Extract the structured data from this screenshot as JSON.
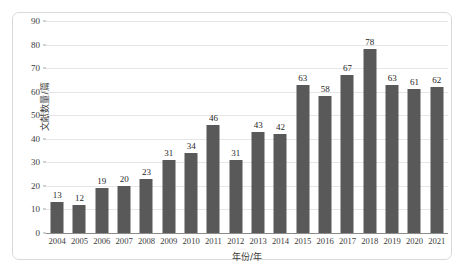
{
  "chart_data": {
    "type": "bar",
    "title": "",
    "subtitle": "",
    "xlabel": "年份/年",
    "ylabel": "文献数量/篇",
    "categories": [
      "2004",
      "2005",
      "2006",
      "2007",
      "2008",
      "2009",
      "2010",
      "2011",
      "2012",
      "2013",
      "2014",
      "2015",
      "2016",
      "2017",
      "2018",
      "2019",
      "2020",
      "2021"
    ],
    "values": [
      13,
      12,
      19,
      20,
      23,
      31,
      34,
      46,
      31,
      43,
      42,
      63,
      58,
      67,
      78,
      63,
      61,
      62
    ],
    "data_labels": [
      "13",
      "12",
      "19",
      "20",
      "23",
      "31",
      "34",
      "46",
      "31",
      "43",
      "42",
      "63",
      "58",
      "67",
      "78",
      "63",
      "61",
      "62"
    ],
    "ylim": [
      0,
      90
    ],
    "ytick_values": [
      0,
      10,
      20,
      30,
      40,
      50,
      60,
      70,
      80,
      90
    ],
    "ytick_labels": [
      "0",
      "10",
      "20",
      "30",
      "40",
      "50",
      "60",
      "70",
      "80",
      "90"
    ],
    "grid": true,
    "legend": null,
    "legend_position": "none",
    "bar_color": "#595959",
    "gridline_color": "#e6e6e6",
    "axis_color": "#8c8c8c",
    "frame_color": "#d9d9d9",
    "background_color": "#ffffff",
    "label_color": "#262626"
  }
}
